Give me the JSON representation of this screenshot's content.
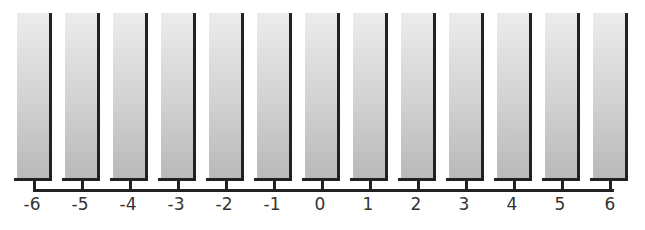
{
  "diagram": {
    "labels": [
      "-6",
      "-5",
      "-4",
      "-3",
      "-2",
      "-1",
      "0",
      "1",
      "2",
      "3",
      "4",
      "5",
      "6"
    ],
    "colors": {
      "bar_top": "#ececec",
      "bar_bottom": "#b9b9b9",
      "line": "#222222",
      "label": "#333333"
    }
  }
}
